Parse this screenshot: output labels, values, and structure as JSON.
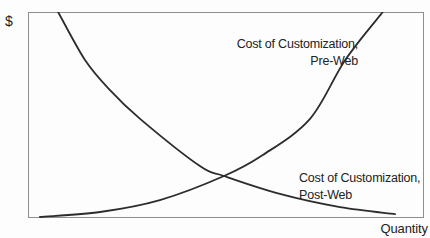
{
  "colors": {
    "curve": "#2c2c2c",
    "frame": "#8f8f8f",
    "background": "#fdfdfd",
    "text": "#222222"
  },
  "chart_data": {
    "type": "line",
    "title": "",
    "xlabel": "Quantity",
    "ylabel": "$",
    "grid": false,
    "axis_ticks": "none",
    "legend_position": "inline-annotations",
    "xlim": [
      0,
      100
    ],
    "ylim": [
      0,
      100
    ],
    "series": [
      {
        "name": "Cost of Customization, Pre-Web",
        "label_line1": "Cost of Customization,",
        "label_line2": "Pre-Web",
        "trend": "increasing",
        "points_pct": [
          [
            3.0,
            0.5
          ],
          [
            18.2,
            2.9
          ],
          [
            33.3,
            8.7
          ],
          [
            49.5,
            20.4
          ],
          [
            59.3,
            30.6
          ],
          [
            71.2,
            48.1
          ],
          [
            80.1,
            76.7
          ],
          [
            89.6,
            100
          ]
        ]
      },
      {
        "name": "Cost of Customization, Post-Web",
        "label_line1": "Cost of Customization,",
        "label_line2": "Post-Web",
        "trend": "decreasing",
        "points_pct": [
          [
            7.6,
            100
          ],
          [
            14.4,
            76.7
          ],
          [
            20.7,
            62.1
          ],
          [
            28.3,
            48.1
          ],
          [
            43.4,
            25.2
          ],
          [
            49.5,
            20.4
          ],
          [
            63.6,
            11.7
          ],
          [
            78.8,
            5.3
          ],
          [
            92.7,
            1.9
          ]
        ]
      }
    ],
    "intersection_pct": [
      49.5,
      20.4
    ]
  }
}
